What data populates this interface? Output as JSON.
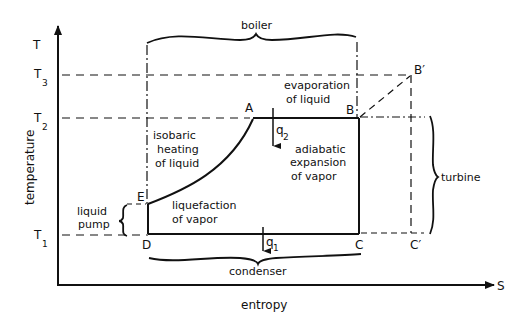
{
  "axes": {
    "y_axis_symbol": "T",
    "x_axis_symbol": "S",
    "y_label": "temperature",
    "x_label": "entropy"
  },
  "temperature_levels": [
    {
      "base": "T",
      "sub": "3"
    },
    {
      "base": "T",
      "sub": "2"
    },
    {
      "base": "T",
      "sub": "1"
    }
  ],
  "points": {
    "A": "A",
    "B": "B",
    "B_prime": "B′",
    "C": "C",
    "C_prime": "C′",
    "D": "D",
    "E": "E"
  },
  "heat_flows": {
    "q2": {
      "base": "q",
      "sub": "2"
    },
    "q1": {
      "base": "q",
      "sub": "1"
    }
  },
  "components": {
    "boiler": "boiler",
    "turbine": "turbine",
    "condenser": "condenser",
    "liquid_pump_line1": "liquid",
    "liquid_pump_line2": "pump"
  },
  "process_labels": {
    "isobaric": [
      "isobaric",
      "heating",
      "of liquid"
    ],
    "evaporation": [
      "evaporation",
      "of liquid"
    ],
    "adiabatic": [
      "adiabatic",
      "expansion",
      "of vapor"
    ],
    "liquefaction": [
      "liquefaction",
      "of vapor"
    ]
  }
}
